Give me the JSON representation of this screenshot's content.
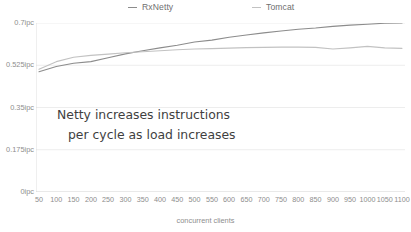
{
  "chart_data": {
    "type": "line",
    "title": "",
    "xlabel": "concurrent clients",
    "ylabel": "",
    "xlim": [
      50,
      1100
    ],
    "ylim": [
      0,
      0.7
    ],
    "grid": true,
    "legend_position": "top",
    "y_tick_labels": [
      "0.7ipc",
      "0.525ipc",
      "0.35ipc",
      "0.175ipc",
      "0ipc"
    ],
    "y_tick_values": [
      0.7,
      0.525,
      0.35,
      0.175,
      0
    ],
    "x_tick_labels": [
      "50",
      "100",
      "150",
      "200",
      "250",
      "300",
      "350",
      "400",
      "450",
      "500",
      "550",
      "600",
      "650",
      "700",
      "750",
      "800",
      "850",
      "900",
      "950",
      "1000",
      "1050",
      "1100"
    ],
    "x": [
      50,
      100,
      150,
      200,
      250,
      300,
      350,
      400,
      450,
      500,
      550,
      600,
      650,
      700,
      750,
      800,
      850,
      900,
      950,
      1000,
      1050,
      1100
    ],
    "series": [
      {
        "name": "RxNetty",
        "color": "#8c8c8c",
        "values": [
          0.498,
          0.52,
          0.533,
          0.54,
          0.556,
          0.572,
          0.585,
          0.597,
          0.608,
          0.621,
          0.629,
          0.641,
          0.65,
          0.659,
          0.667,
          0.674,
          0.679,
          0.686,
          0.691,
          0.695,
          0.699,
          0.7
        ]
      },
      {
        "name": "Tomcat",
        "color": "#c2c2c2",
        "values": [
          0.508,
          0.54,
          0.558,
          0.566,
          0.571,
          0.577,
          0.581,
          0.585,
          0.589,
          0.592,
          0.594,
          0.596,
          0.598,
          0.599,
          0.6,
          0.6,
          0.599,
          0.592,
          0.597,
          0.603,
          0.597,
          0.595
        ]
      }
    ],
    "annotations": [
      {
        "line1": "Netty increases instructions",
        "line2": "per cycle as load increases"
      }
    ]
  },
  "legend": {
    "items": [
      {
        "label": "RxNetty",
        "color": "#8c8c8c"
      },
      {
        "label": "Tomcat",
        "color": "#c2c2c2"
      }
    ]
  },
  "colors": {
    "rxnetty": "#8c8c8c",
    "tomcat": "#c2c2c2",
    "grid": "#ededed",
    "axis": "#d8d8d8",
    "text": "#8d8d8d",
    "annotation": "#3f3f3f",
    "background": "#ffffff"
  }
}
